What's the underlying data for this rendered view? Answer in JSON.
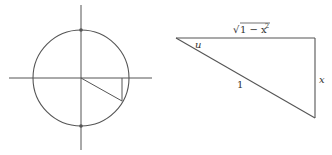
{
  "colors": {
    "background": "#ffffff",
    "stroke": "#555555",
    "text": "#333333"
  },
  "unit_circle": {
    "center": [
      81,
      78
    ],
    "radius": 48,
    "x_axis": {
      "x1": 9,
      "x2": 152,
      "y": 78
    },
    "y_axis": {
      "x": 81,
      "y1": 5,
      "y2": 150
    },
    "top_point": [
      81,
      30
    ],
    "bottom_point": [
      81,
      126
    ],
    "radius_endpoint": [
      122,
      101
    ],
    "projection_top": [
      122,
      78
    ]
  },
  "triangle": {
    "vertices": {
      "left": [
        176,
        38
      ],
      "top_right": [
        315,
        38
      ],
      "bottom_right": [
        315,
        118
      ]
    },
    "labels": {
      "angle": "u",
      "hypotenuse": "1",
      "opposite": "x",
      "adjacent_radical": "√",
      "adjacent_body": "1 − x",
      "adjacent_exponent": "2"
    }
  }
}
